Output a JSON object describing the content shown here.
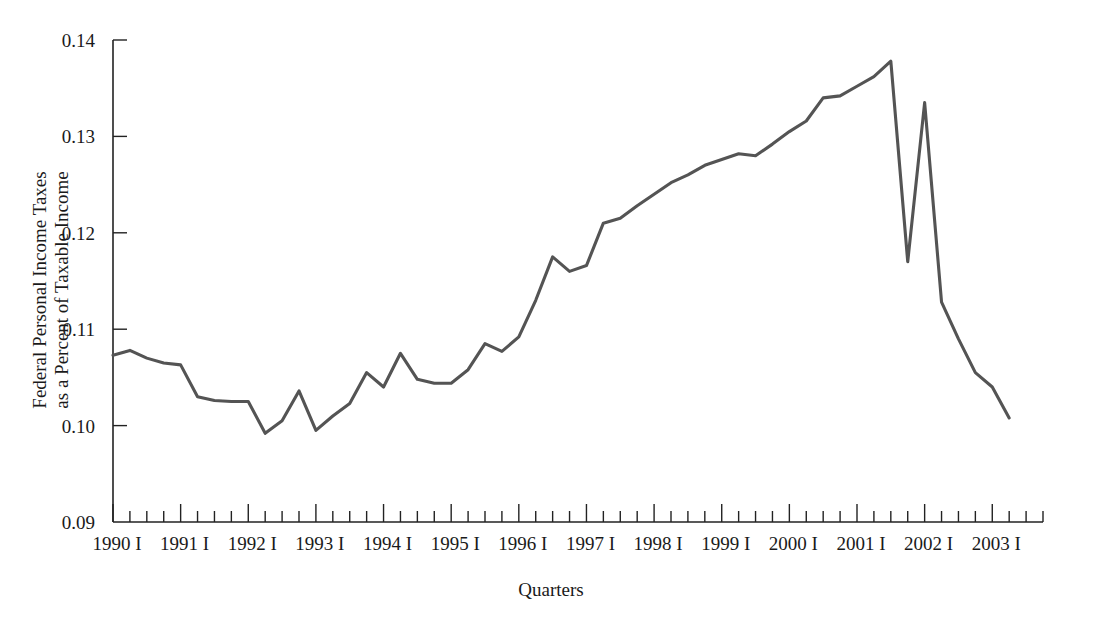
{
  "figure": {
    "background_color": "#ffffff",
    "line_color": "#545454",
    "axis_color": "#222222"
  },
  "chart_data": {
    "type": "line",
    "title": "",
    "xlabel": "Quarters",
    "ylabel": "Federal Personal Income Taxes as a Percent of Taxable Income",
    "ylabel_line1": "Federal Personal Income Taxes",
    "ylabel_line2": "as a Percent of Taxable Income",
    "ylim": [
      0.09,
      0.14
    ],
    "ytick_labels": [
      "0.14",
      "0.13",
      "0.12",
      "0.11",
      "0.10",
      "0.09"
    ],
    "ytick_values": [
      0.14,
      0.13,
      0.12,
      0.11,
      0.1,
      0.09
    ],
    "xtick_labels": [
      "1990 I",
      "1991 I",
      "1992 I",
      "1993 I",
      "1994 I",
      "1995 I",
      "1996 I",
      "1997 I",
      "1998 I",
      "1999 I",
      "2000 I",
      "2001 I",
      "2002 I",
      "2003 I"
    ],
    "xtick_years": [
      1990,
      1991,
      1992,
      1993,
      1994,
      1995,
      1996,
      1997,
      1998,
      1999,
      2000,
      2001,
      2002,
      2003
    ],
    "minor_ticks_per_major": 3,
    "grid": false,
    "legend": null,
    "x_quarters": [
      "1990 I",
      "1990 II",
      "1990 III",
      "1990 IV",
      "1991 I",
      "1991 II",
      "1991 III",
      "1991 IV",
      "1992 I",
      "1992 II",
      "1992 III",
      "1992 IV",
      "1993 I",
      "1993 II",
      "1993 III",
      "1993 IV",
      "1994 I",
      "1994 II",
      "1994 III",
      "1994 IV",
      "1995 I",
      "1995 II",
      "1995 III",
      "1995 IV",
      "1996 I",
      "1996 II",
      "1996 III",
      "1996 IV",
      "1997 I",
      "1997 II",
      "1997 III",
      "1997 IV",
      "1998 I",
      "1998 II",
      "1998 III",
      "1998 IV",
      "1999 I",
      "1999 II",
      "1999 III",
      "1999 IV",
      "2000 I",
      "2000 II",
      "2000 III",
      "2000 IV",
      "2001 I",
      "2001 II",
      "2001 III",
      "2001 IV",
      "2002 I",
      "2002 II",
      "2002 III",
      "2002 IV",
      "2003 I",
      "2003 II"
    ],
    "values": [
      0.1073,
      0.1078,
      0.107,
      0.1065,
      0.1063,
      0.103,
      0.1026,
      0.1025,
      0.1025,
      0.0992,
      0.1005,
      0.1036,
      0.0995,
      0.101,
      0.1023,
      0.1055,
      0.104,
      0.1075,
      0.1048,
      0.1044,
      0.1044,
      0.1058,
      0.1085,
      0.1077,
      0.1092,
      0.113,
      0.1175,
      0.116,
      0.1166,
      0.121,
      0.1215,
      0.1228,
      0.124,
      0.1252,
      0.126,
      0.127,
      0.1276,
      0.1282,
      0.128,
      0.1292,
      0.1305,
      0.1316,
      0.134,
      0.1342,
      0.1352,
      0.1362,
      0.1378,
      0.117,
      0.1335,
      0.1128,
      0.109,
      0.1055,
      0.104,
      0.1008
    ],
    "series_name": "Federal Personal Income Taxes as a Percent of Taxable Income"
  }
}
